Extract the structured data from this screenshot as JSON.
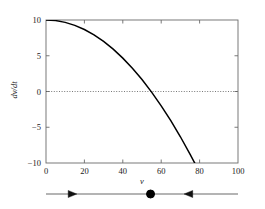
{
  "chart_data": {
    "type": "line",
    "title": "",
    "xlabel": "v",
    "ylabel": "dv/dt",
    "xlim": [
      0,
      100
    ],
    "ylim": [
      -10,
      10
    ],
    "xticks": [
      0,
      20,
      40,
      60,
      80,
      100
    ],
    "xtick_labels": [
      "0",
      "20",
      "40",
      "60",
      "80",
      "100"
    ],
    "yticks": [
      -10,
      -5,
      0,
      5,
      10
    ],
    "ytick_labels": [
      "−10",
      "−5",
      "0",
      "5",
      "10"
    ],
    "grid": false,
    "legend": null,
    "zero_line": {
      "y": 0,
      "style": "dotted"
    },
    "series": [
      {
        "name": "dv/dt",
        "style": "solid",
        "color": "#000000",
        "x": [
          0,
          5,
          10,
          15,
          20,
          25,
          30,
          35,
          40,
          45,
          50,
          55,
          60,
          65,
          70,
          75,
          78
        ],
        "y": [
          10.0,
          9.92,
          9.67,
          9.25,
          8.67,
          7.92,
          7.0,
          5.92,
          4.67,
          3.25,
          1.67,
          -0.08,
          -2.0,
          -4.08,
          -6.33,
          -8.75,
          -10.28
        ]
      }
    ],
    "root": 54.8,
    "annotations": []
  },
  "phase_line": {
    "axis_label": "v",
    "arrows": [
      {
        "direction": "right",
        "position": 11,
        "name": "phase-arrow-right"
      },
      {
        "direction": "left",
        "position": 76,
        "name": "phase-arrow-left"
      }
    ],
    "fixed_points": [
      {
        "value": 54.8,
        "type": "stable",
        "fill": "filled"
      }
    ],
    "range": [
      -4,
      104
    ]
  },
  "style": {
    "axis_color": "#6b6b6b",
    "curve_color": "#000000",
    "text_color": "#1a1a1a",
    "background": "#ffffff"
  }
}
